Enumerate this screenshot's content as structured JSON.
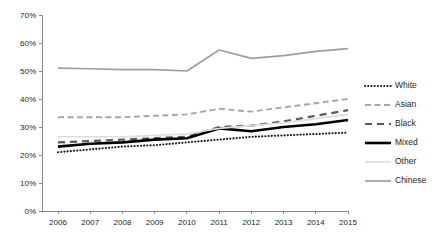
{
  "chart_data": {
    "type": "line",
    "title": "",
    "subtitle": "",
    "xlabel": "",
    "ylabel": "",
    "x": [
      2006,
      2007,
      2008,
      2009,
      2010,
      2011,
      2012,
      2013,
      2014,
      2015
    ],
    "categories": [
      "2006",
      "2007",
      "2008",
      "2009",
      "2010",
      "2011",
      "2012",
      "2013",
      "2014",
      "2015"
    ],
    "ylim": [
      0,
      70
    ],
    "yticks": [
      0,
      10,
      20,
      30,
      40,
      50,
      60,
      70
    ],
    "ytick_labels": [
      "0%",
      "10%",
      "20%",
      "30%",
      "40%",
      "50%",
      "60%",
      "70%"
    ],
    "grid": false,
    "legend_position": "right",
    "series": [
      {
        "name": "White",
        "values": [
          21,
          22,
          23,
          23.5,
          24.5,
          25.5,
          26.5,
          27,
          27.5,
          28
        ],
        "color": "#1a1a1a",
        "style": "dotted",
        "width": 2.1,
        "dasharray": "0.1,3.1",
        "linecap": "round"
      },
      {
        "name": "Asian",
        "values": [
          33.5,
          33.5,
          33.5,
          34,
          34.5,
          36.5,
          35.5,
          37,
          38.5,
          40
        ],
        "color": "#a6a6a6",
        "style": "dashed",
        "width": 1.9,
        "dasharray": "6,3.5",
        "linecap": "butt"
      },
      {
        "name": "Black",
        "values": [
          24.5,
          25,
          25.5,
          26,
          26.5,
          30,
          30.5,
          32,
          34,
          36
        ],
        "color": "#595959",
        "style": "dashed",
        "width": 2.2,
        "dasharray": "7,5",
        "linecap": "butt"
      },
      {
        "name": "Mixed",
        "values": [
          23,
          24,
          24.5,
          25.5,
          26,
          29.5,
          28.5,
          30,
          31,
          32.5
        ],
        "color": "#000000",
        "style": "solid",
        "width": 2.6,
        "dasharray": "none",
        "linecap": "butt"
      },
      {
        "name": "Other",
        "values": [
          26.5,
          26.5,
          26.5,
          27,
          27.5,
          29.5,
          30.5,
          31.5,
          33,
          34.5
        ],
        "color": "#dcdcdc",
        "style": "solid",
        "width": 1.6,
        "dasharray": "none",
        "linecap": "butt"
      },
      {
        "name": "Chinese",
        "values": [
          51,
          50.8,
          50.5,
          50.5,
          50,
          57.5,
          54.5,
          55.5,
          57,
          58
        ],
        "color": "#9e9e9e",
        "style": "solid",
        "width": 1.7,
        "dasharray": "none",
        "linecap": "butt"
      }
    ]
  },
  "legend": {
    "entries": [
      {
        "label": "White"
      },
      {
        "label": "Asian"
      },
      {
        "label": "Black"
      },
      {
        "label": "Mixed"
      },
      {
        "label": "Other"
      },
      {
        "label": "Chinese"
      }
    ]
  },
  "axes": {
    "axis_color": "#8a8a8a"
  }
}
